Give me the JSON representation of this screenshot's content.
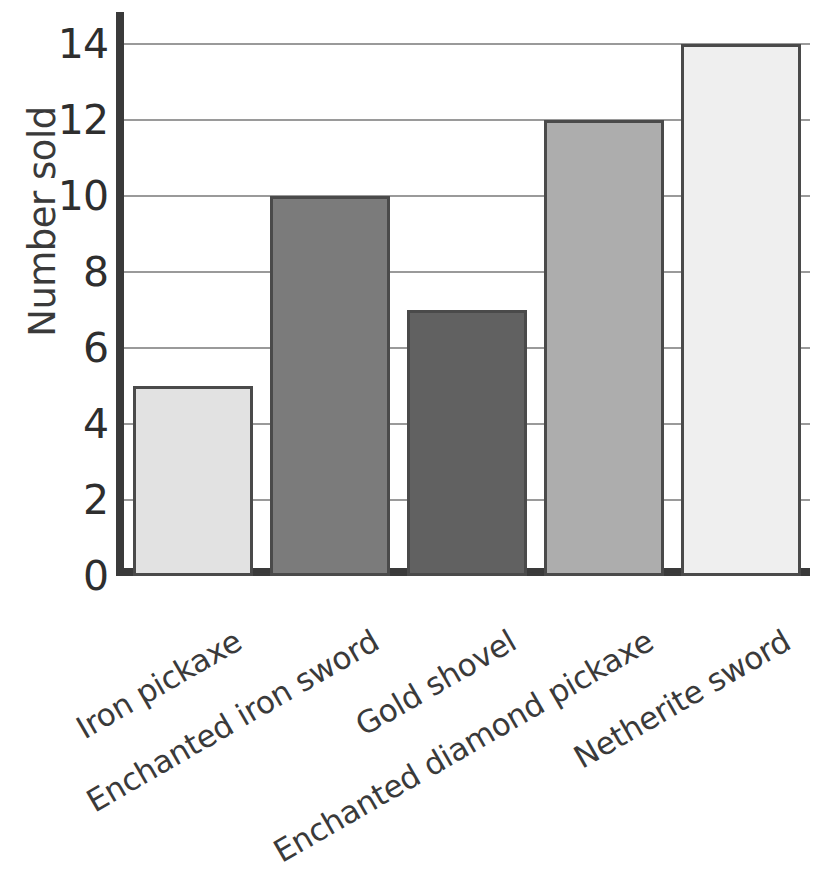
{
  "chart_data": {
    "type": "bar",
    "title": "",
    "xlabel": "",
    "ylabel": "Number sold",
    "categories": [
      "Iron pickaxe",
      "Enchanted iron sword",
      "Gold shovel",
      "Enchanted diamond pickaxe",
      "Netherite sword"
    ],
    "values": [
      5,
      10,
      7,
      12,
      14
    ],
    "ylim": [
      0,
      14.8
    ],
    "yticks": [
      0,
      2,
      4,
      6,
      8,
      10,
      12,
      14
    ],
    "ytick_labels": [
      "0",
      "2",
      "4",
      "6",
      "8",
      "10",
      "12",
      "14"
    ],
    "grid": true,
    "legend": false,
    "bar_colors": [
      "#e2e2e2",
      "#7b7b7b",
      "#616161",
      "#adadad",
      "#efefef"
    ],
    "bar_edge_color": "#4a4a4a",
    "axis_color": "#3a3a3a",
    "gridline_color": "#9a9a9a",
    "text_color": "#333333",
    "background": "#ffffff",
    "xlabel_rotation": -30
  }
}
